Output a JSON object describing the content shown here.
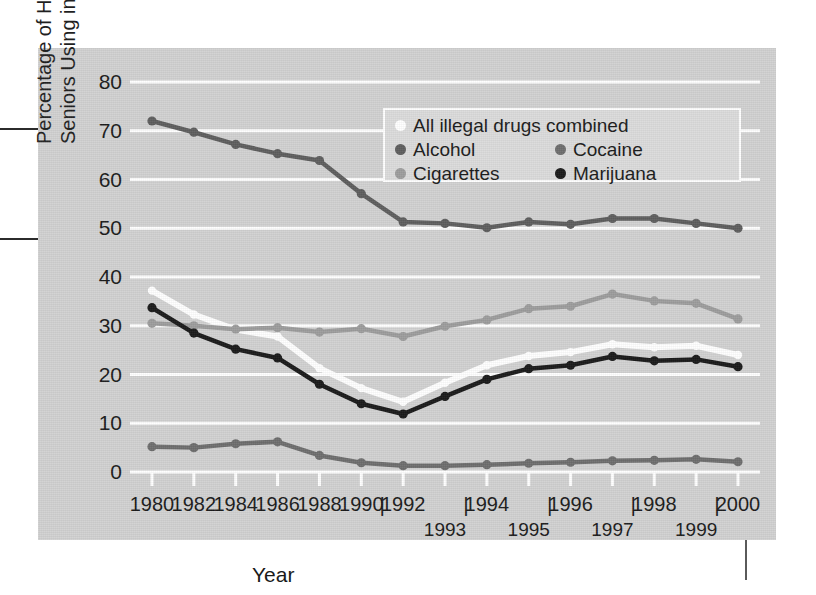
{
  "chart_data": {
    "type": "line",
    "title": "",
    "xlabel": "Year",
    "ylabel_lines": [
      "Percentage of High School",
      "Seniors Using in Past Month"
    ],
    "ylim": [
      0,
      80
    ],
    "yticks": [
      80,
      70,
      60,
      50,
      40,
      30,
      20,
      10,
      0
    ],
    "grid": true,
    "legend_position": "top-center",
    "x": [
      1980,
      1982,
      1984,
      1986,
      1988,
      1990,
      1992,
      1993,
      1994,
      1995,
      1996,
      1997,
      1998,
      1999,
      2000
    ],
    "xticks_upper": [
      "1980",
      "1982",
      "1984",
      "1986",
      "1988",
      "1990",
      "1992",
      "1994",
      "1996",
      "1998",
      "2000"
    ],
    "xticks_lower": [
      "1993",
      "1995",
      "1997",
      "1999"
    ],
    "series": [
      {
        "name": "All illegal drugs combined",
        "color": "#ffffff",
        "values": [
          37.2,
          32.3,
          29.2,
          27.8,
          21.3,
          17.2,
          14.4,
          18.3,
          21.9,
          23.8,
          24.6,
          26.2,
          25.6,
          25.9,
          24.0
        ]
      },
      {
        "name": "Alcohol",
        "color": "#5e5e5e",
        "values": [
          72.0,
          69.7,
          67.2,
          65.3,
          63.9,
          57.1,
          51.3,
          51.0,
          50.1,
          51.3,
          50.8,
          52.0,
          52.0,
          51.0,
          50.0
        ]
      },
      {
        "name": "Cocaine",
        "color": "#6e6e6e",
        "values": [
          5.2,
          5.0,
          5.8,
          6.2,
          3.4,
          1.9,
          1.3,
          1.3,
          1.5,
          1.8,
          2.0,
          2.3,
          2.4,
          2.6,
          2.1
        ]
      },
      {
        "name": "Cigarettes",
        "color": "#9d9d9d",
        "values": [
          30.5,
          30.0,
          29.3,
          29.6,
          28.7,
          29.4,
          27.8,
          29.9,
          31.2,
          33.5,
          34.0,
          36.5,
          35.1,
          34.6,
          31.4
        ]
      },
      {
        "name": "Marijuana",
        "color": "#1a1a1a",
        "values": [
          33.7,
          28.5,
          25.2,
          23.4,
          18.0,
          14.0,
          11.9,
          15.5,
          19.0,
          21.2,
          21.9,
          23.7,
          22.8,
          23.1,
          21.6
        ]
      }
    ]
  },
  "legend": {
    "rows": [
      [
        {
          "label": "All illegal drugs combined",
          "color": "#ffffff"
        }
      ],
      [
        {
          "label": "Alcohol",
          "color": "#5e5e5e"
        },
        {
          "label": "Cocaine",
          "color": "#6e6e6e"
        }
      ],
      [
        {
          "label": "Cigarettes",
          "color": "#9d9d9d"
        },
        {
          "label": "Marijuana",
          "color": "#1a1a1a"
        }
      ]
    ]
  },
  "axis": {
    "x_title": "Year"
  },
  "colors": {
    "panel_bg": "#d2d2d2",
    "gridline": "#ffffff",
    "page_bg": "#ffffff",
    "text": "#1a1a1a"
  }
}
